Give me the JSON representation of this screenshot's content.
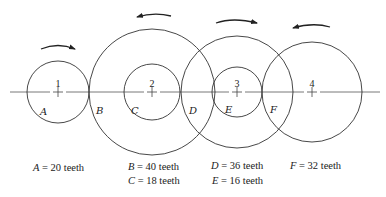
{
  "diagram": {
    "type": "gear-train",
    "centerline_y": 92,
    "gears": [
      {
        "id": "1",
        "center_x": 58,
        "wheels": [
          {
            "label": "A",
            "radius": 31,
            "teeth": 20
          }
        ],
        "rotation": "clockwise"
      },
      {
        "id": "2",
        "center_x": 152,
        "wheels": [
          {
            "label": "B",
            "radius": 63,
            "teeth": 40
          },
          {
            "label": "C",
            "radius": 28,
            "teeth": 18
          }
        ],
        "rotation": "counterclockwise"
      },
      {
        "id": "3",
        "center_x": 237,
        "wheels": [
          {
            "label": "D",
            "radius": 56,
            "teeth": 36
          },
          {
            "label": "E",
            "radius": 25,
            "teeth": 16
          }
        ],
        "rotation": "clockwise"
      },
      {
        "id": "4",
        "center_x": 312,
        "wheels": [
          {
            "label": "F",
            "radius": 50,
            "teeth": 32
          }
        ],
        "rotation": "counterclockwise"
      }
    ],
    "shaft_labels": {
      "g1": "1",
      "g2": "2",
      "g3": "3",
      "g4": "4"
    },
    "wheel_labels": {
      "A": "A",
      "B": "B",
      "C": "C",
      "D": "D",
      "E": "E",
      "F": "F"
    },
    "captions": {
      "a": {
        "var": "A",
        "text": " = 20  teeth"
      },
      "b": {
        "var": "B",
        "text": " = 40  teeth"
      },
      "c": {
        "var": "C",
        "text": " = 18  teeth"
      },
      "d": {
        "var": "D",
        "text": " = 36  teeth"
      },
      "e": {
        "var": "E",
        "text": " = 16  teeth"
      },
      "f": {
        "var": "F",
        "text": " = 32  teeth"
      }
    },
    "line_color": "#333333"
  }
}
